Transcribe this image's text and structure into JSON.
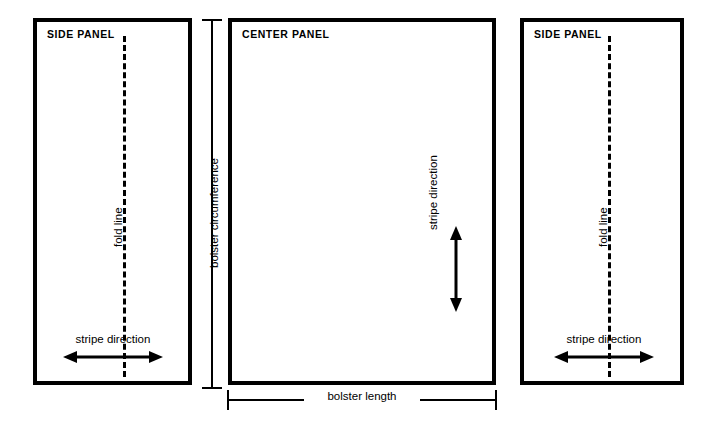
{
  "diagram": {
    "ink_color": "#000000",
    "background_color": "#ffffff"
  },
  "panels": [
    {
      "id": "left",
      "title": "SIDE PANEL",
      "fold_label": "fold line",
      "stripe_label": "stripe direction",
      "stripe_axis": "horizontal",
      "arrow": "double-headed-horizontal-arrow"
    },
    {
      "id": "center",
      "title": "CENTER PANEL",
      "stripe_label": "stripe direction",
      "stripe_axis": "vertical",
      "arrow": "double-headed-vertical-arrow"
    },
    {
      "id": "right",
      "title": "SIDE PANEL",
      "fold_label": "fold line",
      "stripe_label": "stripe direction",
      "stripe_axis": "horizontal",
      "arrow": "double-headed-horizontal-arrow"
    }
  ],
  "dimensions": {
    "circumference": {
      "label": "bolster circumference",
      "orientation": "vertical",
      "cap_style": "tick"
    },
    "length": {
      "label": "bolster length",
      "orientation": "horizontal",
      "cap_style": "tick"
    }
  }
}
